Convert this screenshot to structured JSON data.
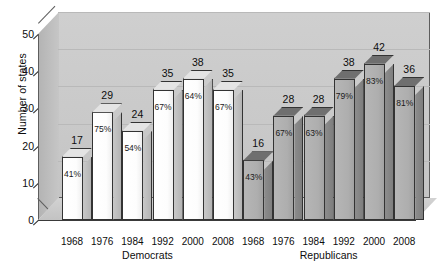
{
  "chart_data": {
    "type": "bar",
    "title": "",
    "xlabel": "",
    "ylabel": "Number of states",
    "ylim": [
      0,
      50
    ],
    "ytick_labels": [
      "0",
      "10",
      "20",
      "30",
      "40",
      "50"
    ],
    "ytick_values": [
      0,
      10,
      20,
      30,
      40,
      50
    ],
    "grid": true,
    "legend": "none",
    "style": "3d-bar",
    "groups": [
      {
        "name": "Democrats",
        "color": "#ffffff",
        "categories": [
          "1968",
          "1976",
          "1984",
          "1992",
          "2000",
          "2008"
        ],
        "values": [
          17,
          29,
          24,
          35,
          38,
          35
        ],
        "percent_labels": [
          "41%",
          "75%",
          "54%",
          "67%",
          "64%",
          "67%"
        ]
      },
      {
        "name": "Republicans",
        "color": "#b6b6b6",
        "categories": [
          "1968",
          "1976",
          "1984",
          "1992",
          "2000",
          "2008"
        ],
        "values": [
          16,
          28,
          28,
          38,
          42,
          36
        ],
        "percent_labels": [
          "43%",
          "67%",
          "63%",
          "79%",
          "83%",
          "81%"
        ]
      }
    ]
  },
  "axes": {
    "y_title": "Number of states"
  }
}
